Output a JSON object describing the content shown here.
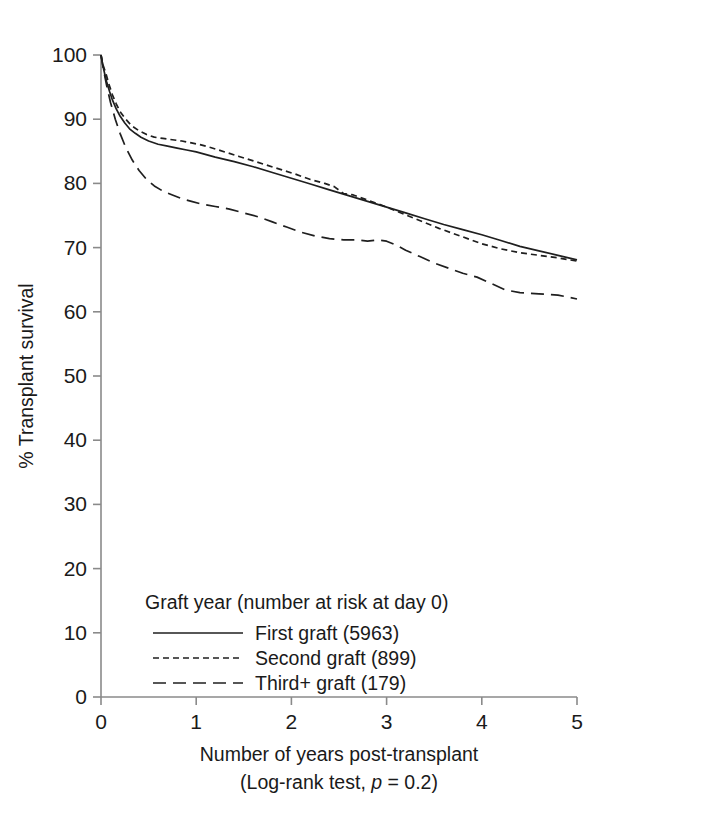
{
  "chart_data": {
    "type": "line",
    "title": "",
    "xlabel": "Number of years post-transplant",
    "xlabel_line2_prefix": "(Log-rank test, ",
    "xlabel_line2_italic": "p",
    "xlabel_line2_suffix": " = 0.2)",
    "ylabel": "% Transplant survival",
    "xlim": [
      0,
      5
    ],
    "ylim": [
      0,
      100
    ],
    "xticks": [
      "0",
      "1",
      "2",
      "3",
      "4",
      "5"
    ],
    "yticks": [
      "0",
      "10",
      "20",
      "30",
      "40",
      "50",
      "60",
      "70",
      "80",
      "90",
      "100"
    ],
    "grid": false,
    "legend_position": "lower-left-inside",
    "legend_title": "Graft year (number at risk at day 0)",
    "statistic_test": "Log-rank test",
    "p_value": "0.2",
    "series": [
      {
        "name": "First graft (5963)",
        "label": "First graft",
        "n_at_risk_day0": 5963,
        "style": "solid",
        "color": "#1f1f1f",
        "x": [
          0.0,
          0.02,
          0.04,
          0.06,
          0.09,
          0.12,
          0.16,
          0.2,
          0.25,
          0.3,
          0.36,
          0.42,
          0.5,
          0.6,
          0.7,
          0.8,
          0.9,
          1.0,
          1.2,
          1.4,
          1.6,
          1.8,
          2.0,
          2.2,
          2.4,
          2.6,
          2.8,
          3.0,
          3.2,
          3.4,
          3.6,
          3.8,
          4.0,
          4.2,
          4.4,
          4.6,
          4.8,
          5.0
        ],
        "y": [
          100.0,
          98.3,
          97.0,
          95.8,
          94.3,
          93.0,
          91.6,
          90.5,
          89.4,
          88.5,
          87.8,
          87.2,
          86.6,
          86.1,
          85.8,
          85.5,
          85.2,
          84.9,
          84.1,
          83.4,
          82.6,
          81.7,
          80.8,
          79.9,
          79.0,
          78.1,
          77.2,
          76.3,
          75.4,
          74.5,
          73.6,
          72.8,
          72.0,
          71.1,
          70.2,
          69.5,
          68.8,
          68.1
        ],
        "key_values": {
          "year_0": 100.0,
          "year_1": 84.9,
          "year_2": 80.8,
          "year_3": 76.3,
          "year_4": 72.0,
          "year_5": 68.1
        }
      },
      {
        "name": "Second graft (899)",
        "label": "Second graft",
        "n_at_risk_day0": 899,
        "style": "dotted-dash",
        "color": "#1f1f1f",
        "x": [
          0.0,
          0.02,
          0.05,
          0.08,
          0.12,
          0.16,
          0.2,
          0.26,
          0.32,
          0.4,
          0.48,
          0.56,
          0.65,
          0.75,
          0.85,
          0.95,
          1.05,
          1.15,
          1.3,
          1.45,
          1.6,
          1.75,
          1.9,
          2.05,
          2.2,
          2.35,
          2.45,
          2.55,
          2.65,
          2.8,
          2.95,
          3.1,
          3.25,
          3.4,
          3.55,
          3.7,
          3.85,
          4.0,
          4.2,
          4.4,
          4.6,
          4.8,
          5.0
        ],
        "y": [
          100.0,
          98.5,
          97.2,
          95.6,
          93.8,
          92.4,
          91.2,
          90.0,
          89.0,
          88.2,
          87.6,
          87.2,
          87.0,
          86.8,
          86.6,
          86.3,
          86.0,
          85.6,
          84.9,
          84.2,
          83.5,
          82.8,
          82.1,
          81.4,
          80.6,
          80.0,
          79.5,
          78.4,
          78.2,
          77.4,
          76.6,
          75.7,
          74.8,
          73.9,
          73.0,
          72.2,
          71.4,
          70.6,
          69.8,
          69.2,
          68.8,
          68.4,
          67.9
        ],
        "key_values": {
          "year_0": 100.0,
          "year_1": 86.2,
          "year_2": 81.6,
          "year_3": 76.2,
          "year_4": 70.6,
          "year_5": 67.9
        }
      },
      {
        "name": "Third+ graft (179)",
        "label": "Third+ graft",
        "n_at_risk_day0": 179,
        "style": "dashed",
        "color": "#1f1f1f",
        "x": [
          0.0,
          0.03,
          0.06,
          0.1,
          0.15,
          0.2,
          0.26,
          0.33,
          0.4,
          0.48,
          0.56,
          0.65,
          0.75,
          0.85,
          0.95,
          1.05,
          1.2,
          1.35,
          1.5,
          1.65,
          1.8,
          1.95,
          2.1,
          2.25,
          2.4,
          2.55,
          2.7,
          2.8,
          2.9,
          3.0,
          3.1,
          3.2,
          3.35,
          3.5,
          3.65,
          3.8,
          3.95,
          4.1,
          4.25,
          4.4,
          4.6,
          4.8,
          5.0
        ],
        "y": [
          100.0,
          97.4,
          95.2,
          92.6,
          90.0,
          87.8,
          85.6,
          83.6,
          82.0,
          80.6,
          79.6,
          78.8,
          78.2,
          77.6,
          77.2,
          76.8,
          76.4,
          76.0,
          75.4,
          74.8,
          74.0,
          73.2,
          72.4,
          71.8,
          71.4,
          71.2,
          71.2,
          71.0,
          71.2,
          71.0,
          70.4,
          69.6,
          68.6,
          67.6,
          66.8,
          66.0,
          65.4,
          64.4,
          63.4,
          63.0,
          62.8,
          62.6,
          62.0
        ],
        "key_values": {
          "year_0": 100.0,
          "year_1": 76.8,
          "year_2": 72.8,
          "year_3": 71.0,
          "year_4": 64.8,
          "year_5": 62.0
        }
      }
    ]
  }
}
